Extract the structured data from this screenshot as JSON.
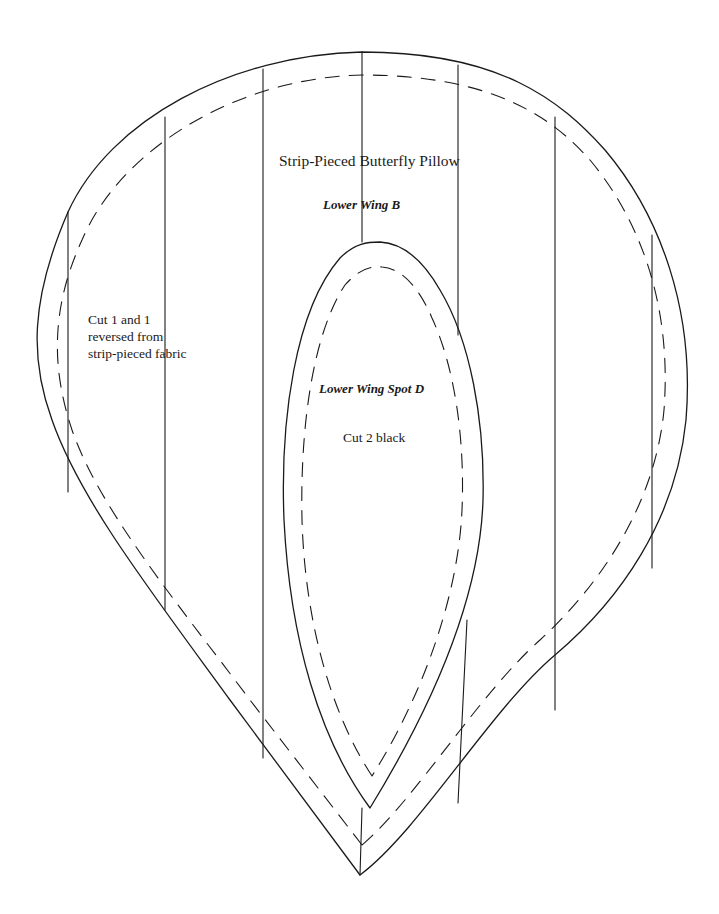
{
  "title": "Strip-Pieced Butterfly Pillow",
  "pieces": [
    {
      "id": "B",
      "name": "Lower Wing B",
      "instructions": "Cut 1 and 1\nreversed from\nstrip-pieced fabric"
    },
    {
      "id": "D",
      "name": "Lower Wing Spot D",
      "instructions": "Cut 2 black"
    }
  ],
  "legend": {
    "solid_line": "cutting line",
    "dashed_line": "seam line",
    "vertical_lines": "strip seams"
  },
  "colors": {
    "line": "#1a1a1a",
    "background": "#ffffff"
  }
}
